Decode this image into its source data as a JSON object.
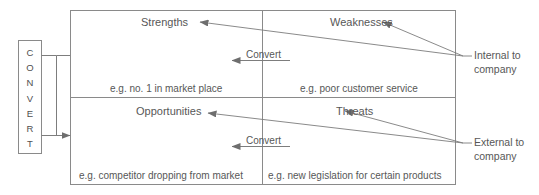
{
  "diagram": {
    "type": "swot-matrix",
    "colors": {
      "line": "#808080",
      "text": "#575757",
      "background": "#ffffff"
    },
    "convert_box": {
      "name": "convert-vertical-box",
      "letters": [
        "C",
        "O",
        "N",
        "V",
        "E",
        "R",
        "T"
      ],
      "text": "CONVERT"
    },
    "quadrants": [
      {
        "id": "strengths",
        "label": "Strengths",
        "example": "e.g. no. 1 in market place",
        "position": "top-left"
      },
      {
        "id": "weaknesses",
        "label": "Weaknesses",
        "example": "e.g. poor customer service",
        "position": "top-right"
      },
      {
        "id": "opportunities",
        "label": "Opportunities",
        "example": "e.g. competitor dropping from market",
        "position": "bottom-left"
      },
      {
        "id": "threats",
        "label": "Threats",
        "example": "e.g. new legislation for certain products",
        "position": "bottom-right"
      }
    ],
    "convert_arrows": [
      {
        "id": "convert-top",
        "label": "Convert"
      },
      {
        "id": "convert-bottom",
        "label": "Convert"
      }
    ],
    "side_labels": [
      {
        "id": "internal",
        "line1": "Internal to",
        "line2": "company",
        "text": "Internal to company"
      },
      {
        "id": "external",
        "line1": "External to",
        "line2": "company",
        "text": "External to company"
      }
    ]
  }
}
